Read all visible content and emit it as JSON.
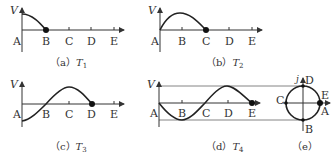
{
  "figure": {
    "axis_label": "V",
    "point_labels": [
      "A",
      "B",
      "C",
      "D",
      "E"
    ],
    "panels": [
      {
        "id": "a",
        "caption_prefix": "（a）",
        "caption_var": "T",
        "caption_sub": "1",
        "endpoint": "B",
        "description": "quarter cycle descending from max at A to zero at B"
      },
      {
        "id": "b",
        "caption_prefix": "（b）",
        "caption_var": "T",
        "caption_sub": "2",
        "endpoint": "C",
        "description": "rises from zero at A to max at B, back to zero at C"
      },
      {
        "id": "c",
        "caption_prefix": "（c）",
        "caption_var": "T",
        "caption_sub": "3",
        "endpoint": "D",
        "description": "from min at A through zero at B to max at C, zero at D"
      },
      {
        "id": "d",
        "caption_prefix": "（d）",
        "caption_var": "T",
        "caption_sub": "4",
        "endpoint": "E",
        "description": "from zero at A to min at B, zero at C, max at D, zero at E"
      },
      {
        "id": "e",
        "caption_prefix": "（e）",
        "description": "reference circle with points D top, B bottom, C left, E/A right",
        "axis_label": "j",
        "circle_labels": {
          "top": "D",
          "bottom": "B",
          "left": "C",
          "right_top": "E",
          "right_bottom": "A"
        }
      }
    ]
  }
}
